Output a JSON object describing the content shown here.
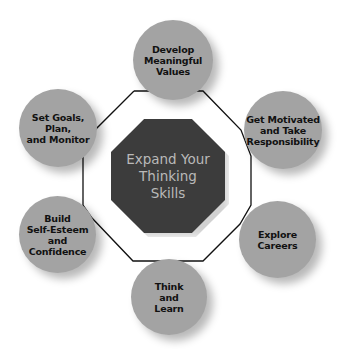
{
  "diagram": {
    "type": "hub-and-ring",
    "center": {
      "label": "Expand Your\nThinking\nSkills",
      "fill": "#3c3c3c",
      "text_color": "#b9b9b9"
    },
    "node_fill": "#a3a3a3",
    "line_color": "#111111",
    "nodes": [
      {
        "id": "values",
        "label": "Develop\nMeaningful\nValues"
      },
      {
        "id": "motivated",
        "label": "Get Motivated\nand Take\nResponsibility"
      },
      {
        "id": "careers",
        "label": "Explore\nCareers"
      },
      {
        "id": "learn",
        "label": "Think\nand\nLearn"
      },
      {
        "id": "esteem",
        "label": "Build\nSelf-Esteem\nand\nConfidence"
      },
      {
        "id": "goals",
        "label": "Set Goals, Plan,\nand Monitor"
      }
    ]
  }
}
